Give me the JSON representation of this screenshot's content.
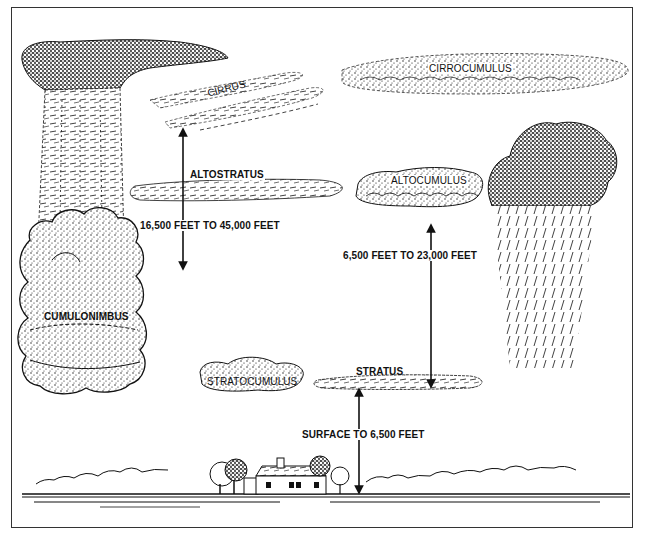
{
  "diagram": {
    "type": "cloud-types-by-altitude",
    "clouds": {
      "cirrus": "CIRRUS",
      "cirrocumulus": "CIRROCUMULUS",
      "altostratus": "ALTOSTRATUS",
      "altocumulus": "ALTOCUMULUS",
      "cumulonimbus": "CUMULONIMBUS",
      "stratocumulus": "STRATOCUMULUS",
      "stratus": "STRATUS"
    },
    "altitude_ranges": {
      "high": "16,500 FEET TO 45,000 FEET",
      "middle": "6,500 FEET TO 23,000 FEET",
      "low": "SURFACE TO 6,500 FEET"
    },
    "colors": {
      "ink": "#111111",
      "paper": "#ffffff",
      "frame": "#333333"
    }
  }
}
